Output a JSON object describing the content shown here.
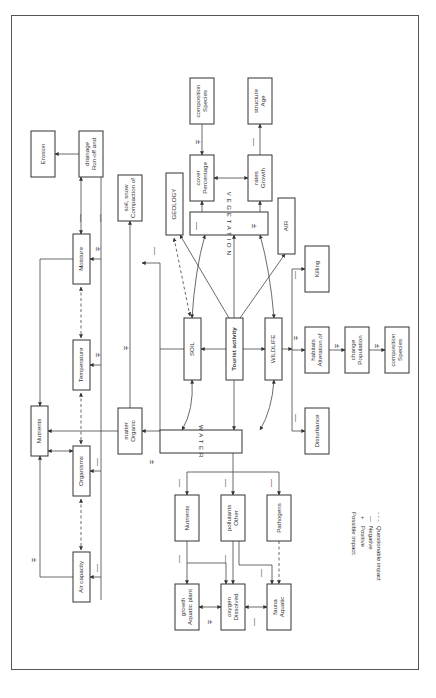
{
  "diagram": {
    "title": "",
    "orientation": "rotated-90-clockwise",
    "nodes": [
      {
        "id": "tourist",
        "label": "Tourist activity",
        "x": 226,
        "y": 318,
        "w": 17,
        "h": 62,
        "bold": true
      },
      {
        "id": "soil",
        "label": "SOIL",
        "x": 184,
        "y": 318,
        "w": 17,
        "h": 62,
        "color": "#2a7a4a"
      },
      {
        "id": "wildlife",
        "label": "WILDLIFE",
        "x": 265,
        "y": 318,
        "w": 17,
        "h": 62,
        "color": "#2a2a7a"
      },
      {
        "id": "water",
        "label": "W A T E R",
        "x": 160,
        "y": 430,
        "w": 82,
        "h": 23,
        "letterspaced": true
      },
      {
        "id": "vegetation",
        "label": "V E G E T A T I O N",
        "x": 190,
        "y": 212,
        "w": 78,
        "h": 23,
        "letterspaced": true
      },
      {
        "id": "geology",
        "label": "GEOLOGY",
        "x": 166,
        "y": 173,
        "w": 17,
        "h": 62
      },
      {
        "id": "air",
        "label": "AIR",
        "x": 278,
        "y": 198,
        "w": 17,
        "h": 56,
        "color": "#2a2a7a"
      },
      {
        "id": "compaction",
        "label": "Compaction of soil, snow",
        "x": 118,
        "y": 175,
        "w": 24,
        "h": 46
      },
      {
        "id": "percent_cover",
        "label": "Percentage cover",
        "x": 190,
        "y": 155,
        "w": 24,
        "h": 46
      },
      {
        "id": "growth_rates",
        "label": "Growth rates",
        "x": 248,
        "y": 155,
        "w": 24,
        "h": 46
      },
      {
        "id": "species_comp_top",
        "label": "Species composition",
        "x": 190,
        "y": 78,
        "w": 24,
        "h": 46
      },
      {
        "id": "age_structure",
        "label": "Age structure",
        "x": 248,
        "y": 78,
        "w": 24,
        "h": 46
      },
      {
        "id": "runoff",
        "label": "Run-off and drainage",
        "x": 79,
        "y": 131,
        "w": 24,
        "h": 46
      },
      {
        "id": "erosion",
        "label": "Erosion",
        "x": 31,
        "y": 131,
        "w": 24,
        "h": 46
      },
      {
        "id": "moisture",
        "label": "Moisture",
        "x": 73,
        "y": 234,
        "w": 17,
        "h": 50
      },
      {
        "id": "temperature",
        "label": "Temperature",
        "x": 73,
        "y": 340,
        "w": 17,
        "h": 50
      },
      {
        "id": "organic_matter",
        "label": "Organic matter",
        "x": 118,
        "y": 408,
        "w": 24,
        "h": 46
      },
      {
        "id": "nutrients_soil",
        "label": "Nutrients",
        "x": 31,
        "y": 406,
        "w": 17,
        "h": 50
      },
      {
        "id": "organisms",
        "label": "Organisms",
        "x": 73,
        "y": 446,
        "w": 17,
        "h": 50
      },
      {
        "id": "air_capacity",
        "label": "Air capacity",
        "x": 73,
        "y": 552,
        "w": 17,
        "h": 50
      },
      {
        "id": "killing",
        "label": "Killing",
        "x": 305,
        "y": 246,
        "w": 24,
        "h": 46
      },
      {
        "id": "alteration",
        "label": "Alteration of habitats",
        "x": 305,
        "y": 327,
        "w": 24,
        "h": 46
      },
      {
        "id": "population_change",
        "label": "Population change",
        "x": 345,
        "y": 327,
        "w": 24,
        "h": 46,
        "color": "#2a2a7a"
      },
      {
        "id": "species_comp_right",
        "label": "Species composition",
        "x": 385,
        "y": 327,
        "w": 24,
        "h": 46
      },
      {
        "id": "disturbance",
        "label": "Disturbance",
        "x": 305,
        "y": 408,
        "w": 24,
        "h": 46
      },
      {
        "id": "nutrients_water",
        "label": "Nutrients",
        "x": 175,
        "y": 495,
        "w": 24,
        "h": 46
      },
      {
        "id": "other_pollutants",
        "label": "Other pollutants",
        "x": 221,
        "y": 495,
        "w": 24,
        "h": 46
      },
      {
        "id": "pathogens",
        "label": "Pathogens",
        "x": 267,
        "y": 495,
        "w": 24,
        "h": 46
      },
      {
        "id": "aquatic_plant",
        "label": "Aquatic plant growth",
        "x": 175,
        "y": 584,
        "w": 24,
        "h": 46
      },
      {
        "id": "dissolved_oxygen",
        "label": "Dissolved oxygen",
        "x": 221,
        "y": 584,
        "w": 24,
        "h": 46
      },
      {
        "id": "aquatic_fauna",
        "label": "Aquatic fauna",
        "x": 267,
        "y": 584,
        "w": 24,
        "h": 46
      }
    ],
    "signs": [
      {
        "text": "±",
        "x": 198,
        "y": 142
      },
      {
        "text": "—",
        "x": 254,
        "y": 142
      },
      {
        "text": "—",
        "x": 197,
        "y": 226
      },
      {
        "text": "±",
        "x": 254,
        "y": 226
      },
      {
        "text": "—",
        "x": 155,
        "y": 251
      },
      {
        "text": "±",
        "x": 126,
        "y": 348
      },
      {
        "text": "—",
        "x": 81,
        "y": 218
      },
      {
        "text": "—",
        "x": 101,
        "y": 218
      },
      {
        "text": "±",
        "x": 98,
        "y": 249
      },
      {
        "text": "±",
        "x": 98,
        "y": 355
      },
      {
        "text": "—",
        "x": 98,
        "y": 462
      },
      {
        "text": "—",
        "x": 98,
        "y": 568
      },
      {
        "text": "±",
        "x": 34,
        "y": 560
      },
      {
        "text": "±",
        "x": 152,
        "y": 462
      },
      {
        "text": "—",
        "x": 296,
        "y": 275
      },
      {
        "text": "±",
        "x": 296,
        "y": 338
      },
      {
        "text": "±",
        "x": 337,
        "y": 346
      },
      {
        "text": "±",
        "x": 377,
        "y": 346
      },
      {
        "text": "—",
        "x": 296,
        "y": 418
      },
      {
        "text": "—",
        "x": 180,
        "y": 483
      },
      {
        "text": "—",
        "x": 226,
        "y": 483
      },
      {
        "text": "—",
        "x": 272,
        "y": 483
      },
      {
        "text": "—",
        "x": 180,
        "y": 559
      },
      {
        "text": "—",
        "x": 226,
        "y": 559
      },
      {
        "text": "—",
        "x": 262,
        "y": 573
      },
      {
        "text": "±",
        "x": 210,
        "y": 622
      },
      {
        "text": "—",
        "x": 255,
        "y": 622
      }
    ],
    "legend": {
      "title": "Possible impact:",
      "items": [
        {
          "symbol": "+",
          "label": "Positive"
        },
        {
          "symbol": "—",
          "label": "Negative"
        },
        {
          "symbol": "- - -",
          "label": "Questionable impact"
        }
      ]
    }
  }
}
